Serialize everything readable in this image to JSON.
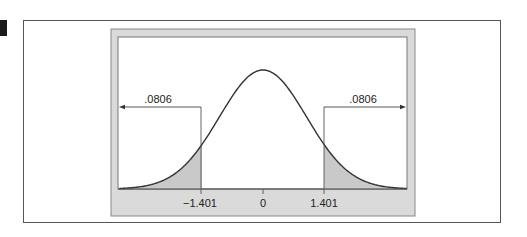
{
  "chart_data": {
    "type": "area",
    "title": "",
    "xlabel": "",
    "ylabel": "",
    "x_ticks": [
      {
        "value": -1.401,
        "label": "−1.401"
      },
      {
        "value": 0,
        "label": "0"
      },
      {
        "value": 1.401,
        "label": "1.401"
      }
    ],
    "xlim": [
      -3.3,
      3.3
    ],
    "series": [
      {
        "name": "normal density",
        "mean": 0,
        "sd": 1
      }
    ],
    "shaded_regions": [
      {
        "from": -3.3,
        "to": -1.401,
        "area": ".0806",
        "side": "left"
      },
      {
        "from": 1.401,
        "to": 3.3,
        "area": ".0806",
        "side": "right"
      }
    ],
    "annotations": [
      {
        "text": ".0806",
        "position": "left-tail",
        "arrow": "left"
      },
      {
        "text": ".0806",
        "position": "right-tail",
        "arrow": "right"
      }
    ],
    "grid": false,
    "legend": null,
    "colors": {
      "curve": "#333333",
      "shade": "#c9c9c9",
      "frame": "#d9d9d9"
    }
  },
  "figure": {
    "left_annotation": ".0806",
    "right_annotation": ".0806",
    "tick_neg": "−1.401",
    "tick_zero": "0",
    "tick_pos": "1.401"
  }
}
